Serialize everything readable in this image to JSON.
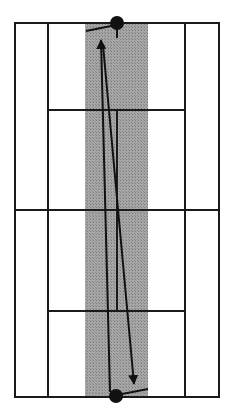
{
  "diagram": {
    "type": "tennis-court-top-view",
    "colors": {
      "background": "#ffffff",
      "lines": "#1a1a1a",
      "shaded_zone": "#9a9a9a",
      "player": "#111111"
    },
    "court": {
      "outer": {
        "x1": 15,
        "y1": 23,
        "x2": 219,
        "y2": 397
      },
      "singles_left_x": 48,
      "singles_right_x": 185,
      "service_line_top_y": 110,
      "service_line_bottom_y": 311,
      "net_y": 210,
      "center_line_x": 117
    },
    "shaded_zone": {
      "x": 85,
      "y": 23,
      "width": 63,
      "height": 374
    },
    "players": [
      {
        "name": "top-player",
        "cx": 117,
        "cy": 23,
        "r": 7,
        "racket": {
          "x1": 111,
          "y1": 26,
          "x2": 86,
          "y2": 31
        },
        "leg": {
          "x1": 117,
          "y1": 30,
          "x2": 117,
          "y2": 38
        }
      },
      {
        "name": "bottom-player",
        "cx": 116,
        "cy": 396,
        "r": 7,
        "racket": {
          "x1": 122,
          "y1": 394,
          "x2": 148,
          "y2": 389
        }
      }
    ],
    "trajectories": [
      {
        "name": "shot-up",
        "x1": 110,
        "y1": 400,
        "x2": 102,
        "y2": 40
      },
      {
        "name": "shot-down",
        "x1": 103,
        "y1": 45,
        "x2": 133,
        "y2": 384
      }
    ]
  }
}
